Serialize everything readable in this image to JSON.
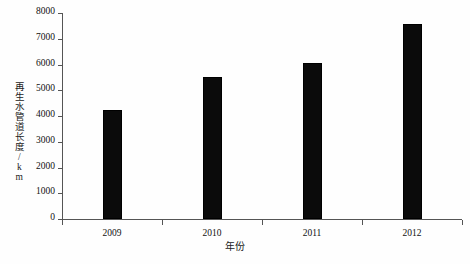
{
  "chart_data": {
    "type": "bar",
    "title": "",
    "subtitle": "",
    "xlabel": "年份",
    "ylabel": "再生水管道长度/km",
    "categories": [
      "2009",
      "2010",
      "2011",
      "2012"
    ],
    "values": [
      4250,
      5520,
      6050,
      7570
    ],
    "series": [
      {
        "name": "再生水管道长度",
        "values": [
          4250,
          5520,
          6050,
          7570
        ]
      }
    ],
    "ylim": [
      0,
      8000
    ],
    "ytick_labels": [
      "0",
      "1000",
      "2000",
      "3000",
      "4000",
      "5000",
      "6000",
      "7000",
      "8000"
    ],
    "ytick_values": [
      0,
      1000,
      2000,
      3000,
      4000,
      5000,
      6000,
      7000,
      8000
    ],
    "xtick_labels": [
      "2009",
      "2010",
      "2011",
      "2012"
    ],
    "grid": false,
    "legend": false,
    "legend_position": "none",
    "bar_color": "#0b0b0b",
    "axis_color": "#555555",
    "background_color": "#fefefe"
  }
}
